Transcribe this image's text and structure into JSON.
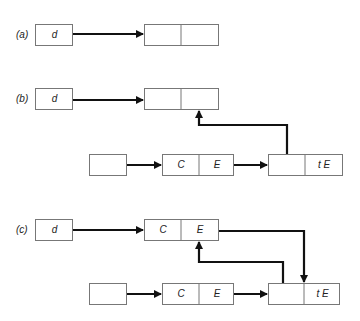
{
  "panels": [
    {
      "label": "(a)",
      "var_box": "d",
      "target": [
        "",
        ""
      ]
    },
    {
      "label": "(b)",
      "var_box": "d",
      "target": [
        "",
        ""
      ],
      "chain": [
        [
          ""
        ],
        [
          "C",
          "E"
        ],
        [
          "",
          "t E"
        ]
      ]
    },
    {
      "label": "(c)",
      "var_box": "d",
      "target": [
        "C",
        "E"
      ],
      "chain": [
        [
          ""
        ],
        [
          "C",
          "E"
        ],
        [
          "",
          "t E"
        ]
      ]
    }
  ]
}
